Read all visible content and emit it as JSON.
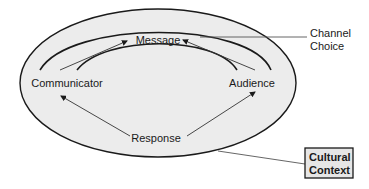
{
  "diagram": {
    "nodes": {
      "message": "Message",
      "communicator": "Communicator",
      "audience": "Audience",
      "response": "Response"
    },
    "callouts": {
      "channel_choice": {
        "line1": "Channel",
        "line2": "Choice"
      },
      "cultural_context": {
        "line1": "Cultural",
        "line2": "Context"
      }
    },
    "edges": [
      {
        "from": "Communicator",
        "to": "Message"
      },
      {
        "from": "Audience",
        "to": "Message"
      },
      {
        "from": "Response",
        "to": "Communicator"
      },
      {
        "from": "Response",
        "to": "Audience"
      }
    ],
    "colors": {
      "ellipse_fill": "#ececec",
      "stroke": "#1a1a1a",
      "callout_box_fill": "#e6e6e6"
    }
  }
}
